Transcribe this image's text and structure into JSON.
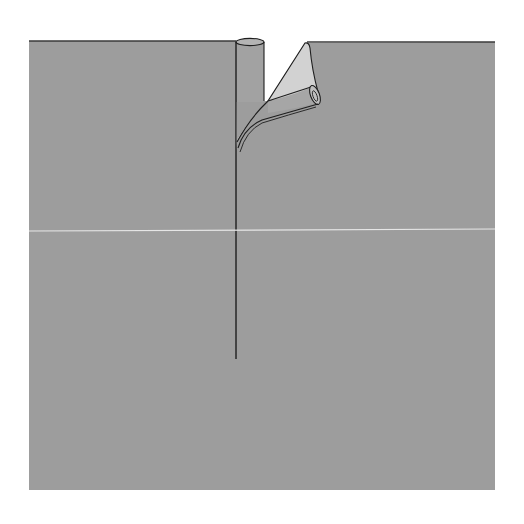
{
  "figure": {
    "description": "Illustration of a gray sheet with a vertical seam; left edge shown as a rolled cylinder, right edge peeled back and curled over exposing its lighter underside",
    "colors": {
      "background": "#ffffff",
      "sheet": "#9d9d9d",
      "sheet_top_edge": "#3a3a3a",
      "underside": "#d2d2d2",
      "line": "#1e1e1e",
      "highlight_line": "#e6e6e6"
    },
    "sheet": {
      "x": 29,
      "y": 40,
      "width": 466,
      "height": 450
    },
    "seam": {
      "x": 236,
      "y_start": 46,
      "y_end": 359
    },
    "horizontal_line": {
      "y": 231
    }
  }
}
